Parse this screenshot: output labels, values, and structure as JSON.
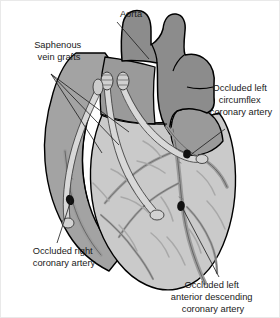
{
  "figure": {
    "background_color": "#ffffff"
  },
  "palette": {
    "aorta_fill": "#8c8c8c",
    "pulmonary_fill": "#9a9a9a",
    "right_chamber_fill": "#a3a3a3",
    "ventricle_fill": "#cacaca",
    "graft_fill": "#d8d8d8",
    "vessel_fill": "#9b9b9b",
    "outline_color": "#000000",
    "occlusion_color": "#111111",
    "text_color": "#1a1a1a"
  },
  "labels": [
    {
      "id": "aorta",
      "name": "aorta-label",
      "lines": [
        "Aorta"
      ],
      "x": 130,
      "y": 16,
      "anchor": "middle",
      "leader": [
        [
          116,
          21
        ],
        [
          148,
          58
        ]
      ]
    },
    {
      "id": "saphenous-vein-grafts",
      "name": "saphenous-vein-grafts-label",
      "lines": [
        "Saphenous",
        "vein grafts"
      ],
      "x": 58,
      "y": 47,
      "anchor": "middle",
      "leader_fan": [
        [
          [
            50,
            73
          ],
          [
            128,
            131
          ]
        ],
        [
          [
            50,
            73
          ],
          [
            118,
            144
          ]
        ],
        [
          [
            50,
            73
          ],
          [
            101,
            152
          ]
        ]
      ]
    },
    {
      "id": "occluded-left-circumflex",
      "name": "occluded-left-circumflex-label",
      "lines": [
        "Occluded left",
        "circumflex",
        "coronary artery"
      ],
      "x": 240,
      "y": 90,
      "anchor": "middle",
      "leader": [
        [
          224,
          128
        ],
        [
          188,
          155
        ]
      ]
    },
    {
      "id": "occluded-right-coronary",
      "name": "occluded-right-coronary-label",
      "lines": [
        "Occluded right",
        "coronary artery"
      ],
      "x": 63,
      "y": 253,
      "anchor": "middle",
      "leader": [
        [
          56,
          242
        ],
        [
          70,
          199
        ]
      ]
    },
    {
      "id": "occluded-left-anterior-descending",
      "name": "occluded-lad-label",
      "lines": [
        "Occluded left",
        "anterior descending",
        "coronary artery"
      ],
      "x": 212,
      "y": 287,
      "anchor": "middle",
      "leader": [
        [
          218,
          276
        ],
        [
          182,
          208
        ]
      ]
    }
  ],
  "occlusion_markers": [
    {
      "name": "occlusion-marker-right-coronary",
      "cx": 69,
      "cy": 199,
      "rx": 4.0,
      "ry": 5.2,
      "rotate": -20
    },
    {
      "name": "occlusion-marker-circumflex",
      "cx": 186,
      "cy": 153,
      "rx": 3.8,
      "ry": 4.4,
      "rotate": 10
    },
    {
      "name": "occlusion-marker-lad",
      "cx": 180,
      "cy": 205,
      "rx": 3.8,
      "ry": 5.0,
      "rotate": 8
    }
  ],
  "anatomy": {
    "aorta_name": "aorta-shape",
    "pulmonary_trunk_name": "pulmonary-trunk-shape",
    "right_chamber_name": "right-heart-chamber-shape",
    "ventricle_name": "left-ventricle-shape",
    "left_appendage_name": "left-atrial-appendage-shape",
    "grafts_name": "saphenous-graft-tubes",
    "coronary_vessels_name": "coronary-vessel-network"
  }
}
